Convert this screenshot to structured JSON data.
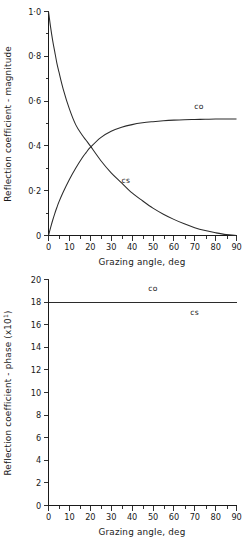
{
  "chart_data": [
    {
      "type": "line",
      "id": "reflection-magnitude",
      "title": "",
      "xlabel": "Grazing angle, deg",
      "ylabel": "Reflection coefficient - magnitude",
      "xlim": [
        0,
        90
      ],
      "ylim": [
        0,
        1.0
      ],
      "grid": false,
      "legend_position": "inline-annotation",
      "xticks": [
        0,
        10,
        20,
        30,
        40,
        50,
        60,
        70,
        80,
        90
      ],
      "xtick_labels": [
        "0",
        "10",
        "20",
        "30",
        "40",
        "50",
        "60",
        "70",
        "80",
        "90"
      ],
      "yticks": [
        0,
        0.2,
        0.4,
        0.6,
        0.8,
        1.0
      ],
      "ytick_labels": [
        "0",
        "0·2",
        "0·4",
        "0·6",
        "0·8",
        "1·0"
      ],
      "x": [
        0,
        1,
        2,
        3,
        4,
        5,
        7,
        10,
        13,
        16,
        18,
        20,
        25,
        30,
        35,
        40,
        45,
        50,
        55,
        60,
        65,
        70,
        75,
        80,
        85,
        90
      ],
      "series": [
        {
          "name": "cs",
          "label": "cs",
          "label_x": 37,
          "label_y": 0.235,
          "values": [
            1.0,
            0.93,
            0.87,
            0.82,
            0.77,
            0.73,
            0.655,
            0.565,
            0.495,
            0.45,
            0.425,
            0.4,
            0.335,
            0.28,
            0.235,
            0.19,
            0.155,
            0.122,
            0.095,
            0.072,
            0.052,
            0.035,
            0.022,
            0.012,
            0.004,
            0.0
          ]
        },
        {
          "name": "co",
          "label": "co",
          "label_x": 72,
          "label_y": 0.565,
          "values": [
            0.0,
            0.035,
            0.068,
            0.098,
            0.125,
            0.15,
            0.193,
            0.25,
            0.3,
            0.345,
            0.37,
            0.393,
            0.437,
            0.465,
            0.483,
            0.495,
            0.503,
            0.508,
            0.512,
            0.515,
            0.517,
            0.518,
            0.519,
            0.52,
            0.52,
            0.52
          ]
        }
      ]
    },
    {
      "type": "line",
      "id": "reflection-phase",
      "title": "",
      "xlabel": "Grazing angle, deg",
      "ylabel": "Reflection coefficient - phase (x10¹)",
      "xlim": [
        0,
        90
      ],
      "ylim": [
        0,
        20
      ],
      "grid": false,
      "legend_position": "inline-annotation",
      "xticks": [
        0,
        10,
        20,
        30,
        40,
        50,
        60,
        70,
        80,
        90
      ],
      "xtick_labels": [
        "0",
        "10",
        "20",
        "30",
        "40",
        "50",
        "60",
        "70",
        "80",
        "90"
      ],
      "yticks": [
        0,
        2,
        4,
        6,
        8,
        10,
        12,
        14,
        16,
        18,
        20
      ],
      "ytick_labels": [
        "0",
        "2",
        "4",
        "6",
        "8",
        "10",
        "12",
        "14",
        "16",
        "18",
        "20"
      ],
      "x": [
        0,
        90
      ],
      "series": [
        {
          "name": "co",
          "label": "co",
          "label_x": 50,
          "label_y": 19.0,
          "values": [
            18.0,
            18.0
          ]
        },
        {
          "name": "cs",
          "label": "cs",
          "label_x": 70,
          "label_y": 16.9,
          "values": [
            18.0,
            18.0
          ]
        }
      ]
    }
  ],
  "figures": {
    "magnitude": {
      "ylabel": "Reflection coefficient - magnitude",
      "xlabel": "Grazing angle, deg",
      "ytick_0": "0",
      "ytick_1": "0·2",
      "ytick_2": "0·4",
      "ytick_3": "0·6",
      "ytick_4": "0·8",
      "ytick_5": "1·0",
      "xtick_0": "0",
      "xtick_1": "10",
      "xtick_2": "20",
      "xtick_3": "30",
      "xtick_4": "40",
      "xtick_5": "50",
      "xtick_6": "60",
      "xtick_7": "70",
      "xtick_8": "80",
      "xtick_9": "90",
      "label_co": "co",
      "label_cs": "cs"
    },
    "phase": {
      "ylabel_main": "Reflection coefficient - phase (x10",
      "ylabel_exp": "1",
      "ylabel_close": ")",
      "xlabel": "Grazing angle, deg",
      "ytick_0": "0",
      "ytick_1": "2",
      "ytick_2": "4",
      "ytick_3": "6",
      "ytick_4": "8",
      "ytick_5": "10",
      "ytick_6": "12",
      "ytick_7": "14",
      "ytick_8": "16",
      "ytick_9": "18",
      "ytick_10": "20",
      "xtick_0": "0",
      "xtick_1": "10",
      "xtick_2": "20",
      "xtick_3": "30",
      "xtick_4": "40",
      "xtick_5": "50",
      "xtick_6": "60",
      "xtick_7": "70",
      "xtick_8": "80",
      "xtick_9": "90",
      "label_co": "co",
      "label_cs": "cs"
    }
  },
  "colors": {
    "background": "#ffffff",
    "ink": "#1a1a1a",
    "curve": "#2b2b2b"
  }
}
